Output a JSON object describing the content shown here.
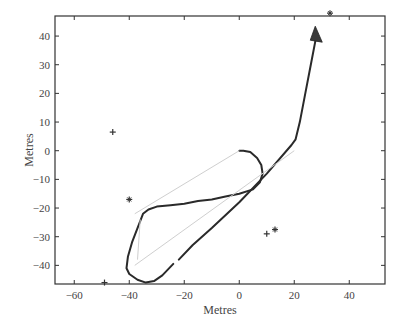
{
  "chart_data": {
    "type": "line",
    "title": "",
    "xlabel": "Metres",
    "ylabel": "Metres",
    "xlim": [
      -67,
      53
    ],
    "ylim": [
      -46.5,
      47
    ],
    "grid": false,
    "legend": null,
    "xticks": [
      -60,
      -40,
      -20,
      0,
      20,
      40
    ],
    "yticks": [
      -40,
      -30,
      -20,
      -10,
      0,
      10,
      20,
      30,
      40
    ],
    "series": [
      {
        "name": "trajectory",
        "style": "thick dark line",
        "color": "#2a2a2a",
        "points": [
          [
            28,
            40
          ],
          [
            26,
            30
          ],
          [
            24,
            20
          ],
          [
            22,
            10
          ],
          [
            20.5,
            4
          ],
          [
            19,
            2
          ],
          [
            10,
            -8
          ],
          [
            0,
            -18
          ],
          [
            -10,
            -27
          ],
          [
            -17,
            -33
          ],
          [
            -22,
            -38
          ]
        ]
      },
      {
        "name": "trajectory-continued",
        "style": "thick dark line",
        "color": "#2a2a2a",
        "points": [
          [
            -24,
            -39.5
          ],
          [
            -28,
            -43.5
          ],
          [
            -31,
            -45.5
          ],
          [
            -34,
            -46
          ],
          [
            -37,
            -45
          ],
          [
            -40,
            -43
          ],
          [
            -41,
            -41
          ],
          [
            -40.5,
            -37
          ],
          [
            -39,
            -32
          ],
          [
            -37,
            -27
          ],
          [
            -35,
            -22
          ],
          [
            -33,
            -20.5
          ],
          [
            -30,
            -19.5
          ],
          [
            -25,
            -19
          ],
          [
            -20,
            -18.5
          ],
          [
            -15,
            -17.5
          ],
          [
            -10,
            -17
          ],
          [
            -5,
            -16
          ],
          [
            0,
            -15
          ],
          [
            5,
            -13.5
          ],
          [
            7.5,
            -11
          ],
          [
            8.5,
            -8
          ],
          [
            8,
            -5
          ],
          [
            6.5,
            -2.5
          ],
          [
            4,
            -0.5
          ],
          [
            1.5,
            0
          ],
          [
            0,
            0
          ]
        ]
      },
      {
        "name": "reference-chords",
        "style": "thin light gray line",
        "color": "#cfcfcf",
        "segments": [
          [
            [
              0,
              0
            ],
            [
              -38,
              -22
            ]
          ],
          [
            [
              -38,
              -40
            ],
            [
              20,
              0
            ]
          ],
          [
            [
              -36,
              -24
            ],
            [
              -37,
              -38
            ]
          ]
        ]
      },
      {
        "name": "landmarks",
        "style": "markers",
        "color": "#333333",
        "points": [
          {
            "x": -46,
            "y": 6.5,
            "marker": "+"
          },
          {
            "x": -40,
            "y": -17,
            "marker": "*"
          },
          {
            "x": 10,
            "y": -29,
            "marker": "+"
          },
          {
            "x": 13,
            "y": -27.5,
            "marker": "*"
          },
          {
            "x": -49,
            "y": -46,
            "marker": "+"
          },
          {
            "x": 33,
            "y": 48,
            "marker": "*"
          }
        ]
      },
      {
        "name": "vehicle",
        "style": "filled triangle (heading marker)",
        "color": "#3a3a3a",
        "points": [
          [
            28,
            41
          ]
        ]
      }
    ]
  },
  "axes": {
    "x_label": "Metres",
    "y_label": "Metres",
    "x_tick_labels": [
      "−60",
      "−40",
      "−20",
      "0",
      "20",
      "40"
    ],
    "y_tick_labels": [
      "40",
      "30",
      "20",
      "10",
      "0",
      "−10",
      "−20",
      "−30",
      "−40"
    ]
  },
  "colors": {
    "axis": "#333333",
    "trajectory": "#2a2a2a",
    "chord": "#d0d0d0",
    "marker": "#333333"
  }
}
